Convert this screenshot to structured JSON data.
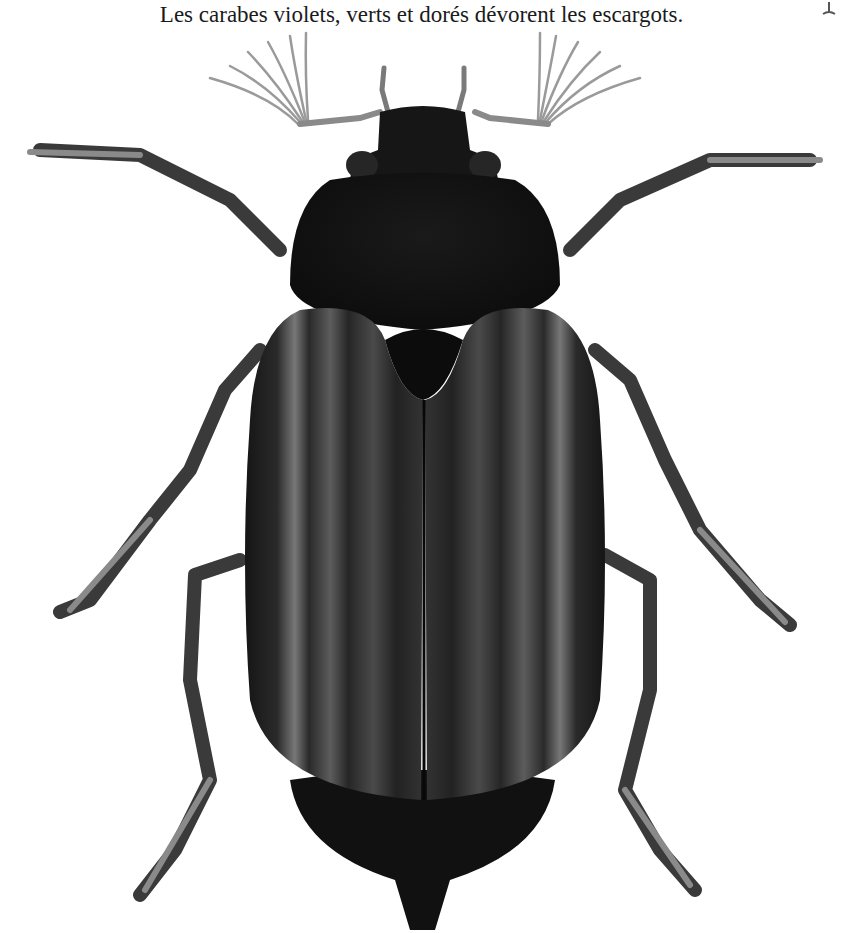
{
  "caption": {
    "text": "Les carabes violets, verts et dorés dévorent les escargots."
  },
  "illustration": {
    "subject": "beetle-illustration",
    "description": "Black beetle, dorsal view, with fan-shaped antennae and six legs",
    "colors": {
      "body": "#141414",
      "highlight": "#5a5a5a",
      "legs": "#3a3a3a",
      "antennae": "#9a9a9a",
      "background": "#ffffff"
    }
  }
}
